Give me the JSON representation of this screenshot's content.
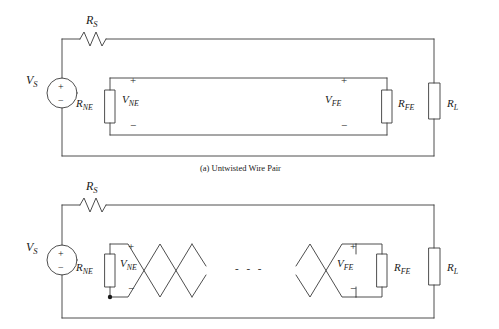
{
  "figure": {
    "caption_a": "(a) Untwisted Wire Pair",
    "dots": "- - -",
    "stroke_color": "#3a3a3a",
    "background": "#ffffff"
  },
  "circuit_a": {
    "source_label": "V",
    "source_sub": "S",
    "rs_label": "R",
    "rs_sub": "S",
    "rne_label": "R",
    "rne_sub": "NE",
    "rfe_label": "R",
    "rfe_sub": "FE",
    "rl_label": "R",
    "rl_sub": "L",
    "vne_label": "V",
    "vne_sub": "NE",
    "vfe_label": "V",
    "vfe_sub": "FE",
    "plus_ne": "+",
    "minus_ne": "−",
    "plus_fe": "+",
    "minus_fe": "−",
    "source_plus": "+",
    "source_minus": "−"
  },
  "circuit_b": {
    "source_label": "V",
    "source_sub": "S",
    "rs_label": "R",
    "rs_sub": "S",
    "rne_label": "R",
    "rne_sub": "NE",
    "rfe_label": "R",
    "rfe_sub": "FE",
    "rl_label": "R",
    "rl_sub": "L",
    "vne_label": "V",
    "vne_sub": "NE",
    "vfe_label": "V",
    "vfe_sub": "FE",
    "plus_ne": "+",
    "minus_ne": "−",
    "plus_fe": "+",
    "minus_fe": "−",
    "source_plus": "+",
    "source_minus": "−"
  }
}
